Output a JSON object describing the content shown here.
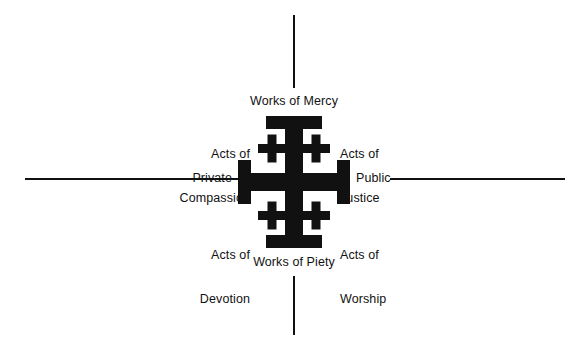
{
  "diagram": {
    "type": "jerusalem-cross-quadrant",
    "colors": {
      "ink": "#111111",
      "background": "#ffffff"
    },
    "axes": {
      "vertical": {
        "top_label": "Works of Mercy",
        "bottom_label": "Works of Piety"
      },
      "horizontal": {
        "left_label": "Private",
        "right_label": "Public"
      }
    },
    "quadrants": [
      {
        "position": "upper-left",
        "line1": "Acts of",
        "line2": "Compassion",
        "text": "Acts of Compassion"
      },
      {
        "position": "upper-right",
        "line1": "Acts of",
        "line2": "Justice",
        "text": "Acts of Justice"
      },
      {
        "position": "lower-left",
        "line1": "Acts of",
        "line2": "Devotion",
        "text": "Acts of Devotion"
      },
      {
        "position": "lower-right",
        "line1": "Acts of",
        "line2": "Worship",
        "text": "Acts of Worship"
      }
    ],
    "symbol": {
      "name": "jerusalem-cross",
      "description": "Large central cross potent with four small crosslets in the quadrants"
    }
  }
}
